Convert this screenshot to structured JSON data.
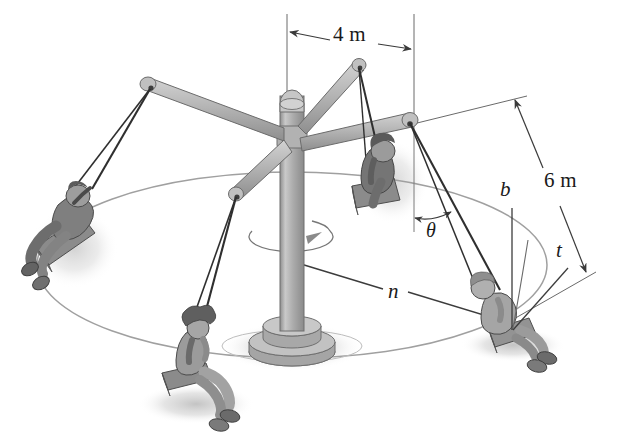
{
  "figure": {
    "labels": {
      "arm_length": "4 m",
      "cable_length": "6 m",
      "angle": "θ",
      "axis_normal": "n",
      "axis_binormal": "b",
      "axis_tangential": "t"
    },
    "colors": {
      "ink": "#1a1a1a",
      "pole_fill": "#b4b4b4",
      "pole_edge": "#6e6e6e",
      "arm_fill": "#b9b9b9",
      "arm_edge": "#6b6b6b",
      "seat_fill": "#8d8d8d",
      "person_fill": "#8a8a8a",
      "person_dark": "#6a6a6a",
      "shadow": "#cfcfcf",
      "ellipse_line": "#9a9a9a",
      "dim_line": "#4a4a4a",
      "background": "#ffffff"
    },
    "riders": [
      {
        "name": "rider-left",
        "position": "left"
      },
      {
        "name": "rider-bottom",
        "position": "bottom-center"
      },
      {
        "name": "rider-upper",
        "position": "upper-right-inner"
      },
      {
        "name": "rider-right",
        "position": "right"
      }
    ],
    "annotations": [
      {
        "name": "dimension-4m",
        "text": "4 m",
        "x": 340,
        "y": 42,
        "kind": "dimension"
      },
      {
        "name": "dimension-6m",
        "text": "6 m",
        "x": 548,
        "y": 186,
        "kind": "dimension"
      },
      {
        "name": "angle-theta",
        "text": "θ",
        "x": 428,
        "y": 235,
        "kind": "angle"
      },
      {
        "name": "axis-n-label",
        "text": "n",
        "x": 394,
        "y": 295,
        "kind": "axis"
      },
      {
        "name": "axis-b-label",
        "text": "b",
        "x": 505,
        "y": 192,
        "kind": "axis"
      },
      {
        "name": "axis-t-label",
        "text": "t",
        "x": 559,
        "y": 252,
        "kind": "axis"
      }
    ]
  }
}
